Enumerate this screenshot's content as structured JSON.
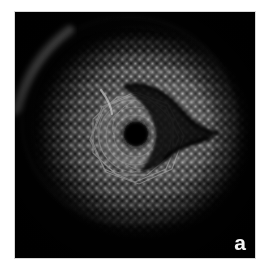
{
  "figure": {
    "panel_label": "a",
    "caption_visible": false,
    "background_color": "#ffffff",
    "frame_color": "#d8d8d8",
    "image_background_color": "#050505",
    "label_color": "#f4f4f4"
  },
  "micrograph": {
    "kind": "grayscale-micrograph",
    "subject": "hexagonal dot lattice disc with central star-polygon defect",
    "image_box": {
      "x": 15,
      "y": 12,
      "width": 240,
      "height": 246
    },
    "disc": {
      "center_x": 126,
      "center_y": 118,
      "radius_x": 112,
      "radius_y": 108,
      "fill_description": "bright dots on dark field, vignetted at rim"
    },
    "lattice": {
      "type": "hexagonal",
      "spacing_px": 8.6,
      "dot_color": "#cdcdcd",
      "field_color": "#0a0a0a"
    },
    "features": [
      {
        "name": "bright-arc-streak",
        "description": "diagonal bright streak across upper-left rim",
        "color": "#c8c8c8"
      },
      {
        "name": "central-star-polygon",
        "description": "decagram of intersecting straight lines around the core",
        "center_x": 133,
        "center_y": 128,
        "outer_radius": 38,
        "points": 10,
        "color": "#9a9a9a"
      },
      {
        "name": "central-dark-core",
        "description": "dark circular void at the polygon centre",
        "center_x": 134,
        "center_y": 128,
        "radius": 15,
        "color": "#070707"
      },
      {
        "name": "comma-defect",
        "description": "dark comma / tadpole shaped crack curving to the right of centre",
        "color": "#060606"
      },
      {
        "name": "rim-vignette",
        "description": "dark vignette around the outer circumference",
        "color": "#000000"
      }
    ]
  }
}
